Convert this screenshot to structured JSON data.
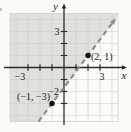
{
  "figure": {
    "axis_labels": {
      "x": "x",
      "y": "y"
    },
    "tick_labels": {
      "x_neg": "−3",
      "x_pos": "3",
      "y_pos": "3",
      "y_neg": "−2"
    },
    "point_labels": {
      "p1": "(2, 1)",
      "p2": "(−1, −3)"
    }
  },
  "chart_data": {
    "type": "line",
    "title": "",
    "xlabel": "x",
    "ylabel": "y",
    "xlim": [
      -4.5,
      4.5
    ],
    "ylim": [
      -4.5,
      4.5
    ],
    "grid": true,
    "points": [
      {
        "x": 2,
        "y": 1,
        "label": "(2, 1)"
      },
      {
        "x": -1,
        "y": -3,
        "label": "(−1, −3)"
      }
    ],
    "boundary_line": {
      "style": "dashed",
      "through_points": [
        [
          -1,
          -3
        ],
        [
          2,
          1
        ]
      ],
      "slope": 1.3333,
      "y_intercept": -1.6667,
      "equation": "y = (4/3)x − 5/3",
      "arrowhead": "upper-right"
    },
    "shaded_region": "half-plane above-left of the dashed line (y > (4/3)x − 5/3)",
    "x_tick_positions": [
      -3,
      -2,
      -1,
      1,
      2,
      3
    ],
    "y_tick_positions": [
      -3,
      -2,
      -1,
      1,
      2,
      3
    ],
    "grid_line_positions": [
      -4,
      -3,
      -2,
      -1,
      1,
      2,
      3,
      4
    ],
    "labeled_ticks": {
      "x": [
        -3,
        3
      ],
      "y": [
        3,
        -2
      ]
    },
    "colors": {
      "shading": "#e1e0dc",
      "grid": "#c9ccd1",
      "dashed_line": "#8c8c8c",
      "axes": "#2b2b2b",
      "points": "#111111",
      "paper": "#fcfbf8"
    }
  }
}
